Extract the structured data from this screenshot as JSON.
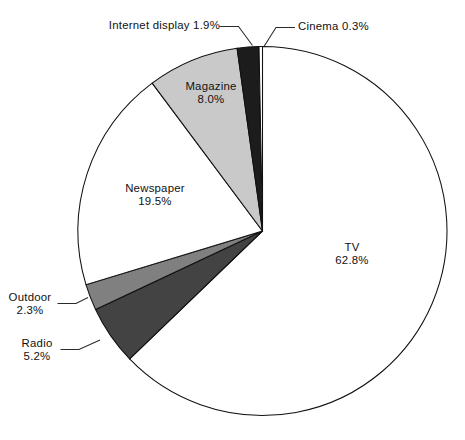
{
  "figure": {
    "background": "#ffffff",
    "width": 465,
    "height": 440
  },
  "chart_data": {
    "type": "pie",
    "title": "",
    "subtitle": "",
    "xlabel": "",
    "ylabel": "",
    "legend_position": "none",
    "grid": false,
    "units": "percent",
    "total": 100.0,
    "start_angle_deg": 90,
    "direction": "clockwise",
    "categories": [
      "TV",
      "Radio",
      "Outdoor",
      "Newspaper",
      "Magazine",
      "Internet display",
      "Cinema"
    ],
    "values": [
      62.8,
      5.2,
      2.3,
      19.5,
      8.0,
      1.9,
      0.3
    ],
    "slices": [
      {
        "name": "TV",
        "label_name": "TV",
        "label_value": "62.8%",
        "value": 62.8,
        "color": "#ffffff",
        "edge_color": "#111111",
        "label_placement": "inside",
        "leader_line": false
      },
      {
        "name": "Radio",
        "label_name": "Radio",
        "label_value": "5.2%",
        "value": 5.2,
        "color": "#434343",
        "edge_color": "#111111",
        "label_placement": "outside",
        "leader_line": true
      },
      {
        "name": "Outdoor",
        "label_name": "Outdoor",
        "label_value": "2.3%",
        "value": 2.3,
        "color": "#808080",
        "edge_color": "#111111",
        "label_placement": "outside",
        "leader_line": true
      },
      {
        "name": "Newspaper",
        "label_name": "Newspaper",
        "label_value": "19.5%",
        "value": 19.5,
        "color": "#ffffff",
        "edge_color": "#111111",
        "label_placement": "inside",
        "leader_line": false
      },
      {
        "name": "Magazine",
        "label_name": "Magazine",
        "label_value": "8.0%",
        "value": 8.0,
        "color": "#c9c9c9",
        "edge_color": "#111111",
        "label_placement": "inside",
        "leader_line": false
      },
      {
        "name": "Internet display",
        "label_name": "Internet display 1.9%",
        "label_value": "1.9%",
        "value": 1.9,
        "color": "#1c1c1c",
        "edge_color": "#111111",
        "label_placement": "outside",
        "leader_line": true
      },
      {
        "name": "Cinema",
        "label_name": "Cinema 0.3%",
        "label_value": "0.3%",
        "value": 0.3,
        "color": "#ffffff",
        "edge_color": "#111111",
        "label_placement": "outside",
        "leader_line": true
      }
    ]
  },
  "labels": {
    "internet_display": {
      "line1": "Internet display 1.9%"
    },
    "cinema": {
      "line1": "Cinema 0.3%"
    },
    "magazine": {
      "line1": "Magazine",
      "line2": "8.0%"
    },
    "newspaper": {
      "line1": "Newspaper",
      "line2": "19.5%"
    },
    "tv": {
      "line1": "TV",
      "line2": "62.8%"
    },
    "outdoor": {
      "line1": "Outdoor",
      "line2": "2.3%"
    },
    "radio": {
      "line1": "Radio",
      "line2": "5.2%"
    }
  }
}
